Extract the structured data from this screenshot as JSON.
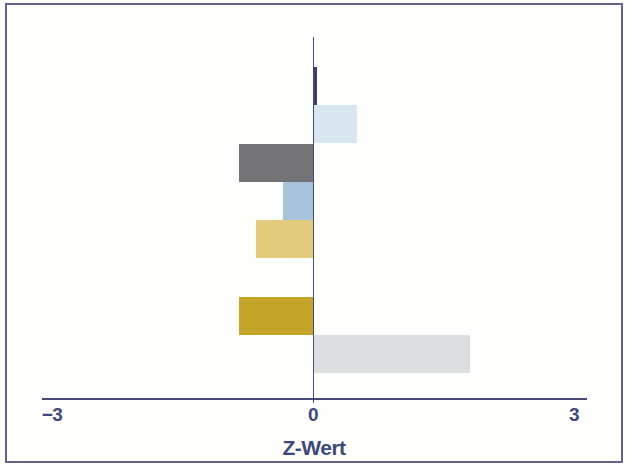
{
  "frame": {
    "border_color": "#62628c",
    "background_color": "#fefefc"
  },
  "chart_data": {
    "type": "bar",
    "orientation": "horizontal",
    "title": "",
    "xlabel": "Z-Wert",
    "ylabel": "",
    "xlim": [
      -3.1,
      3.15
    ],
    "grid": false,
    "legend": "none",
    "axis_color": "#4a4a78",
    "tick_label_color": "#3c4a7c",
    "x_ticks": [
      {
        "value": -3,
        "label": "−3"
      },
      {
        "value": 0,
        "label": "0"
      },
      {
        "value": 3,
        "label": "3"
      }
    ],
    "bars": [
      {
        "slot": 0,
        "name": "dark-navy-bar",
        "value": 0.05,
        "color": "#3d3d7d"
      },
      {
        "slot": 1,
        "name": "pale-blue-bar",
        "value": 0.5,
        "color": "#d7e6f1"
      },
      {
        "slot": 2,
        "name": "dark-gray-bar",
        "value": -0.85,
        "color": "#747476"
      },
      {
        "slot": 3,
        "name": "medium-blue-bar",
        "value": -0.35,
        "color": "#a6c3db"
      },
      {
        "slot": 4,
        "name": "khaki-bar",
        "value": -0.65,
        "color": "#e2cb7a"
      },
      {
        "slot": 6,
        "name": "gold-bar",
        "value": -0.85,
        "color": "#c4a527"
      },
      {
        "slot": 7,
        "name": "light-gray-bar",
        "value": 1.8,
        "color": "#dcdfe0"
      }
    ]
  }
}
